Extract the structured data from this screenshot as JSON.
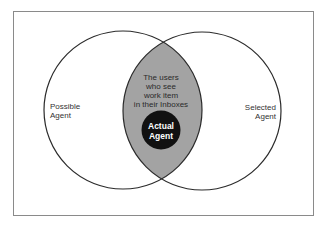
{
  "diagram": {
    "type": "venn",
    "sets": [
      {
        "id": "possible",
        "label_lines": [
          "Possible",
          "Agent"
        ]
      },
      {
        "id": "selected",
        "label_lines": [
          "Selected",
          "Agent"
        ]
      }
    ],
    "intersection": {
      "label_lines": [
        "The users",
        "who see",
        "work item",
        "in their Inboxes"
      ],
      "fill": "#a3a3a3"
    },
    "inner": {
      "label_lines": [
        "Actual",
        "Agent"
      ],
      "fill": "#111111"
    },
    "colors": {
      "stroke": "#2b2b2b",
      "frame": "#8a8a8a",
      "background": "#ffffff"
    }
  }
}
